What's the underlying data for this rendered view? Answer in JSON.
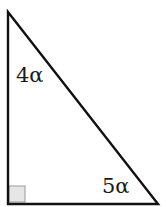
{
  "diagram": {
    "type": "right-triangle",
    "vertices": {
      "top": [
        8,
        12
      ],
      "right_angle": [
        8,
        204
      ],
      "bottom_right": [
        158,
        204
      ]
    },
    "angle_labels": [
      {
        "id": "top-angle",
        "text": "4α"
      },
      {
        "id": "bottom-right-angle",
        "text": "5α"
      }
    ],
    "right_angle_marker": true,
    "colors": {
      "stroke": "#111111",
      "marker_fill": "#e6e6e6",
      "marker_stroke": "#999999"
    }
  }
}
